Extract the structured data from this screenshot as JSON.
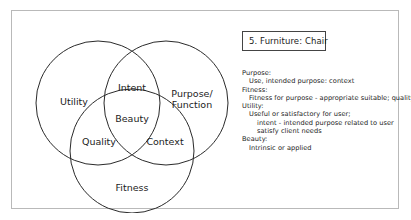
{
  "title_box": {
    "label": "5. Furniture: Chair"
  },
  "venn": {
    "circles": [
      {
        "name": "utility-circle",
        "cx": 72,
        "cy": 70,
        "r": 62
      },
      {
        "name": "purpose-circle",
        "cx": 140,
        "cy": 70,
        "r": 62
      },
      {
        "name": "fitness-circle",
        "cx": 106,
        "cy": 118,
        "r": 62
      }
    ],
    "labels": [
      {
        "name": "utility",
        "text": "Utility",
        "x": 48,
        "y": 72
      },
      {
        "name": "intent",
        "text": "Intent",
        "x": 106,
        "y": 58
      },
      {
        "name": "purpose-function-line1",
        "text": "Purpose/",
        "x": 166,
        "y": 64
      },
      {
        "name": "purpose-function-line2",
        "text": "Function",
        "x": 166,
        "y": 75
      },
      {
        "name": "beauty",
        "text": "Beauty",
        "x": 106,
        "y": 89
      },
      {
        "name": "quality",
        "text": "Quality",
        "x": 73,
        "y": 112
      },
      {
        "name": "context",
        "text": "Context",
        "x": 139,
        "y": 112
      },
      {
        "name": "fitness",
        "text": "Fitness",
        "x": 106,
        "y": 158
      }
    ]
  },
  "notes": [
    {
      "indent": 0,
      "text": "Purpose:"
    },
    {
      "indent": 1,
      "text": "Use, intended purpose: context"
    },
    {
      "indent": 0,
      "text": "Fitness:"
    },
    {
      "indent": 1,
      "text": "Fitness for purpose - appropriate suitable; quality"
    },
    {
      "indent": 0,
      "text": "Utility:"
    },
    {
      "indent": 1,
      "text": "Useful or satisfactory for user;"
    },
    {
      "indent": 2,
      "text": "intent - intended purpose related to user"
    },
    {
      "indent": 2,
      "text": "satisfy client needs"
    },
    {
      "indent": 0,
      "text": "Beauty:"
    },
    {
      "indent": 1,
      "text": "Intrinsic or applied"
    }
  ],
  "colors": {
    "frame_border": "#b9b9b9",
    "box_border": "#444444",
    "circle_stroke": "#2a2a2a",
    "text": "#1c1c1c",
    "background": "#ffffff"
  }
}
